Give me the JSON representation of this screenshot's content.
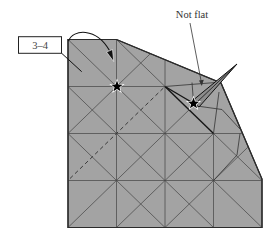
{
  "diagram": {
    "label_box": {
      "text": "3–4"
    },
    "annotation": {
      "text": "Not flat"
    },
    "grid": {
      "rows": 4,
      "cols": 4
    },
    "markers": {
      "star_count": 2
    }
  },
  "colors": {
    "background": "#ffffff",
    "paper": "#a3a3a3",
    "paper_edge": "#2b2b2b",
    "crease": "#4a4a4a",
    "spike": "#8c8c8c",
    "star": "#000000",
    "star_outline": "#ffffff",
    "text": "#333333",
    "label_box_fill": "#ffffff",
    "label_box_stroke": "#222222"
  }
}
